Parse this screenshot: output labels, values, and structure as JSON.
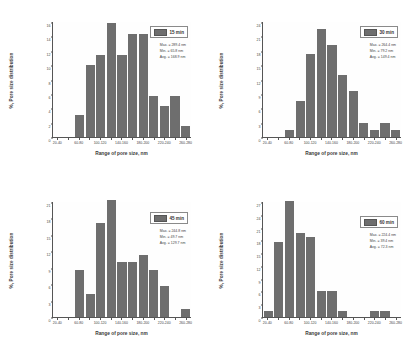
{
  "figure": {
    "panel_count": 4,
    "bar_color": "#6e6e6e",
    "axis_color": "#555555",
    "background": "#ffffff",
    "shared_xlabel": "Range of pore size, nm",
    "shared_ylabel": "%, Pore size distribution",
    "shared_categories": [
      "20-40",
      "40-60",
      "60-80",
      "80-100",
      "100-120",
      "120-140",
      "140-160",
      "160-180",
      "180-200",
      "200-220",
      "220-240",
      "240-260",
      "260-280"
    ],
    "visible_xticklabels": [
      "20-40",
      "",
      "60-80",
      "",
      "100-120",
      "",
      "140-160",
      "",
      "180-200",
      "",
      "220-240",
      "",
      "260-280"
    ]
  },
  "chart_data": [
    {
      "type": "bar",
      "title": "15 min",
      "xlabel": "Range of pore size, nm",
      "ylabel": "%, Pore size distribution",
      "categories": [
        "20-40",
        "40-60",
        "60-80",
        "80-100",
        "100-120",
        "120-140",
        "140-160",
        "160-180",
        "180-200",
        "200-220",
        "220-240",
        "240-260",
        "260-280"
      ],
      "values": [
        0,
        0,
        3.0,
        10.0,
        11.4,
        15.8,
        11.4,
        14.3,
        14.3,
        5.7,
        4.3,
        5.7,
        1.5
      ],
      "extra_values": [
        3.0
      ],
      "ylim": [
        0,
        16
      ],
      "yticks": [
        0,
        2,
        4,
        6,
        8,
        10,
        12,
        14,
        16
      ],
      "grid": false,
      "legend_position": "upper right",
      "legend": "15 min",
      "annotations": {
        "max": "Max. = 289.4 nm",
        "min": "Min. = 65.8 nm",
        "avg": "Avg. = 168.9 nm"
      }
    },
    {
      "type": "bar",
      "title": "30 min",
      "xlabel": "Range of pore size, nm",
      "ylabel": "%, Pore size distribution",
      "categories": [
        "20-40",
        "40-60",
        "60-80",
        "80-100",
        "100-120",
        "120-140",
        "140-160",
        "160-180",
        "180-200",
        "200-220",
        "220-240",
        "240-260",
        "260-280"
      ],
      "values": [
        0,
        0,
        1.5,
        7.6,
        17.3,
        22.5,
        19.2,
        13.0,
        9.5,
        3.0,
        1.5,
        3.0,
        1.5
      ],
      "extra_values": [
        1.5
      ],
      "ylim": [
        0,
        24
      ],
      "yticks": [
        0,
        3,
        6,
        9,
        12,
        15,
        18,
        21,
        24
      ],
      "grid": false,
      "legend_position": "upper right",
      "legend": "30 min",
      "annotations": {
        "max": "Max. = 264.4 nm",
        "min": "Min. = 79.2 nm",
        "avg": "Avg. = 149.4 nm"
      }
    },
    {
      "type": "bar",
      "title": "45 min",
      "xlabel": "Range of pore size, nm",
      "ylabel": "%, Pore size distribution",
      "categories": [
        "20-40",
        "40-60",
        "60-80",
        "80-100",
        "100-120",
        "120-140",
        "140-160",
        "160-180",
        "180-200",
        "200-220",
        "220-240",
        "240-260",
        "260-280"
      ],
      "values": [
        0,
        0,
        8.6,
        4.2,
        17.2,
        21.4,
        10.0,
        10.0,
        11.4,
        8.6,
        5.7,
        0,
        1.4
      ],
      "extra_values": [
        1.4
      ],
      "ylim": [
        0,
        21
      ],
      "yticks": [
        0,
        3,
        6,
        9,
        12,
        15,
        18,
        21
      ],
      "grid": false,
      "legend_position": "upper right",
      "legend": "45 min",
      "annotations": {
        "max": "Max. = 244.8 nm",
        "min": "Min. = 49.7 nm",
        "avg": "Avg. = 129.7 nm"
      }
    },
    {
      "type": "bar",
      "title": "60 min",
      "xlabel": "Range of pore size, nm",
      "ylabel": "%, Pore size distribution",
      "categories": [
        "20-40",
        "40-60",
        "60-80",
        "80-100",
        "100-120",
        "120-140",
        "140-160",
        "160-180",
        "180-200",
        "200-220",
        "220-240",
        "240-260",
        "260-280"
      ],
      "values": [
        1.5,
        17.5,
        27.3,
        19.8,
        18.7,
        6.0,
        6.0,
        1.5,
        0,
        0,
        1.5,
        1.5,
        0
      ],
      "extra_values": [
        1.5
      ],
      "ylim": [
        0,
        27
      ],
      "yticks": [
        0,
        3,
        6,
        9,
        12,
        15,
        18,
        21,
        24,
        27
      ],
      "grid": false,
      "legend_position": "upper right",
      "legend": "60 min",
      "annotations": {
        "max": "Max. = 224.4 nm",
        "min": "Min. = 39.4 nm",
        "avg": "Avg. = 72.3 nm"
      }
    }
  ]
}
